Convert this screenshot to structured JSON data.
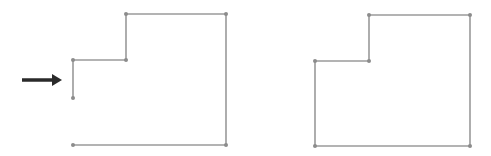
{
  "diagram": {
    "colors": {
      "line": "#9a9a9a",
      "vertex": "#8c8c8c",
      "arrow": "#2a2a2a",
      "background": "#ffffff"
    },
    "left_shape": {
      "closed": false,
      "points": [
        [
          73,
          98
        ],
        [
          73,
          60
        ],
        [
          126,
          60
        ],
        [
          126,
          14
        ],
        [
          226,
          14
        ],
        [
          226,
          145
        ],
        [
          73,
          145
        ]
      ]
    },
    "right_shape": {
      "closed": true,
      "points": [
        [
          315,
          61
        ],
        [
          369,
          61
        ],
        [
          369,
          15
        ],
        [
          470,
          15
        ],
        [
          470,
          146
        ],
        [
          315,
          146
        ]
      ]
    },
    "arrow": {
      "x1": 22,
      "y1": 80,
      "x2": 62,
      "y2": 80
    }
  }
}
